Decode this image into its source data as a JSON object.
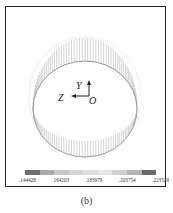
{
  "figure": {
    "caption": "(b)",
    "axes": {
      "y_label": "Y",
      "z_label": "Z",
      "origin_label": "O"
    },
    "colorbar": {
      "labels": [
        ".144428",
        ".164203",
        ".183978",
        ".203754",
        ".223529"
      ],
      "colors": [
        "#6e6e6e",
        "#a8a8a8",
        "#c8c8c8",
        "#d6d6d6",
        "#dedede",
        "#e6e6e6",
        "#d0d0d0",
        "#b4b4b4",
        "#6a6a6a"
      ]
    }
  }
}
